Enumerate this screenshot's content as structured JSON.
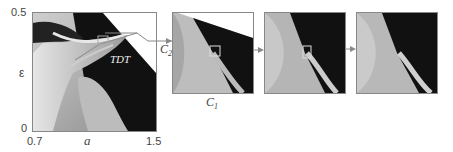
{
  "figure": {
    "main_plot": {
      "y_axis_label": "ε",
      "x_axis_label": "a",
      "y_ticks": [
        "0.5",
        "0"
      ],
      "x_ticks": [
        "0.7",
        "1.5"
      ],
      "annotation": "TDT"
    },
    "zoom_panels": [
      {
        "x_label": "C1_x",
        "y_label": "C2"
      },
      {},
      {}
    ],
    "labels": {
      "c1": "C",
      "c1_sub": "1",
      "c2": "C",
      "c2_sub": "2"
    }
  }
}
